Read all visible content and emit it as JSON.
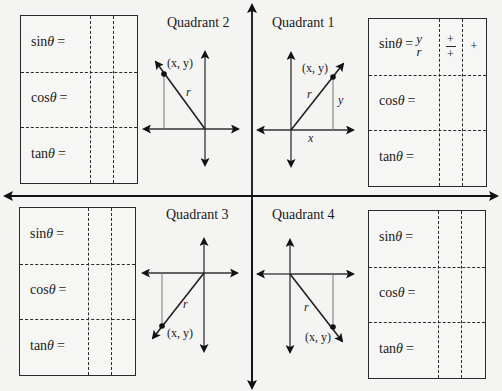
{
  "main_axes": {
    "description": "Coordinate plane divided into four quadrants with arrows on both ends"
  },
  "quadrants": [
    {
      "id": "q2",
      "title": "Quadrant 2",
      "point_label": "(x, y)",
      "radius_label": "r",
      "x_label": "",
      "y_label": ""
    },
    {
      "id": "q1",
      "title": "Quadrant 1",
      "point_label": "(x, y)",
      "radius_label": "r",
      "x_label": "x",
      "y_label": "y"
    },
    {
      "id": "q3",
      "title": "Quadrant 3",
      "point_label": "(x, y)",
      "radius_label": "r",
      "x_label": "",
      "y_label": ""
    },
    {
      "id": "q4",
      "title": "Quadrant 4",
      "point_label": "(x, y)",
      "radius_label": "r",
      "x_label": "",
      "y_label": ""
    }
  ],
  "tables": {
    "top_left": {
      "rows": [
        {
          "fn": "sin",
          "theta": "θ",
          "eq": "=",
          "formula_num": "",
          "formula_den": "",
          "sign_frac_num": "",
          "sign_frac_den": "",
          "sign": ""
        },
        {
          "fn": "cos",
          "theta": "θ",
          "eq": "=",
          "formula_num": "",
          "formula_den": "",
          "sign_frac_num": "",
          "sign_frac_den": "",
          "sign": ""
        },
        {
          "fn": "tan",
          "theta": "θ",
          "eq": "=",
          "formula_num": "",
          "formula_den": "",
          "sign_frac_num": "",
          "sign_frac_den": "",
          "sign": ""
        }
      ]
    },
    "top_right": {
      "rows": [
        {
          "fn": "sin",
          "theta": "θ",
          "eq": "=",
          "formula_num": "y",
          "formula_den": "r",
          "sign_frac_num": "+",
          "sign_frac_den": "+",
          "sign": "+"
        },
        {
          "fn": "cos",
          "theta": "θ",
          "eq": "=",
          "formula_num": "",
          "formula_den": "",
          "sign_frac_num": "",
          "sign_frac_den": "",
          "sign": ""
        },
        {
          "fn": "tan",
          "theta": "θ",
          "eq": "=",
          "formula_num": "",
          "formula_den": "",
          "sign_frac_num": "",
          "sign_frac_den": "",
          "sign": ""
        }
      ]
    },
    "bottom_left": {
      "rows": [
        {
          "fn": "sin",
          "theta": "θ",
          "eq": "=",
          "formula_num": "",
          "formula_den": "",
          "sign_frac_num": "",
          "sign_frac_den": "",
          "sign": ""
        },
        {
          "fn": "cos",
          "theta": "θ",
          "eq": "=",
          "formula_num": "",
          "formula_den": "",
          "sign_frac_num": "",
          "sign_frac_den": "",
          "sign": ""
        },
        {
          "fn": "tan",
          "theta": "θ",
          "eq": "=",
          "formula_num": "",
          "formula_den": "",
          "sign_frac_num": "",
          "sign_frac_den": "",
          "sign": ""
        }
      ]
    },
    "bottom_right": {
      "rows": [
        {
          "fn": "sin",
          "theta": "θ",
          "eq": "=",
          "formula_num": "",
          "formula_den": "",
          "sign_frac_num": "",
          "sign_frac_den": "",
          "sign": ""
        },
        {
          "fn": "cos",
          "theta": "θ",
          "eq": "=",
          "formula_num": "",
          "formula_den": "",
          "sign_frac_num": "",
          "sign_frac_den": "",
          "sign": ""
        },
        {
          "fn": "tan",
          "theta": "θ",
          "eq": "=",
          "formula_num": "",
          "formula_den": "",
          "sign_frac_num": "",
          "sign_frac_den": "",
          "sign": ""
        }
      ]
    }
  }
}
